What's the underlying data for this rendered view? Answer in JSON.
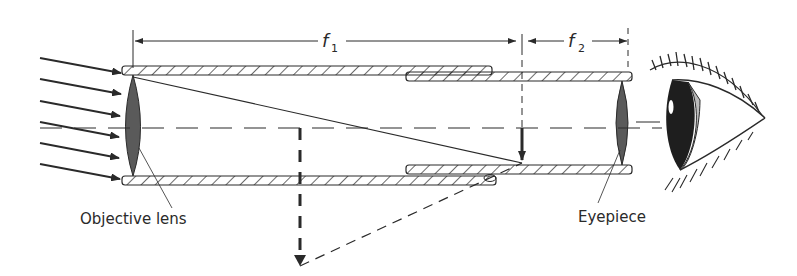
{
  "diagram": {
    "dimensions": {
      "f1_label": "f",
      "f1_sub": "1",
      "f2_label": "f",
      "f2_sub": "2"
    },
    "labels": {
      "objective": "Objective lens",
      "eyepiece": "Eyepiece"
    },
    "colors": {
      "ink": "#2a2a2a",
      "lens_fill": "#5a5a5a",
      "background": "#ffffff"
    }
  }
}
